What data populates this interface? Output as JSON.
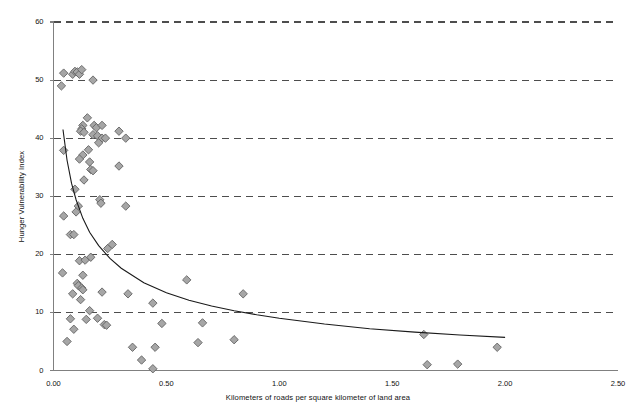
{
  "chart_data": {
    "type": "scatter",
    "title": "",
    "xlabel": "Kilometers of roads per square kilometer of land area",
    "ylabel": "Hunger Vulnerability Index",
    "xlim": [
      0.0,
      2.5
    ],
    "ylim": [
      0,
      60
    ],
    "xticks": [
      0.0,
      0.5,
      1.0,
      1.5,
      2.0,
      2.5
    ],
    "xtick_labels": [
      "0.00",
      "0.50",
      "1.00",
      "1.50",
      "2.00",
      "2.50"
    ],
    "yticks": [
      0,
      10,
      20,
      30,
      40,
      50,
      60
    ],
    "ytick_labels": [
      "0",
      "10",
      "20",
      "30",
      "40",
      "50",
      "60"
    ],
    "grid": "horizontal-dashed",
    "legend": "none",
    "marker": "diamond",
    "marker_fill": "#a6a6a6",
    "marker_stroke": "#636363",
    "marker_size": 4.2,
    "grid_color": "#4d4d4d",
    "axis_color": "#808080",
    "trend_color": "#1a1a1a",
    "points": [
      [
        0.035,
        49.0
      ],
      [
        0.045,
        51.2
      ],
      [
        0.085,
        51.0
      ],
      [
        0.095,
        51.5
      ],
      [
        0.105,
        51.4
      ],
      [
        0.115,
        51.0
      ],
      [
        0.125,
        51.8
      ],
      [
        0.175,
        50.0
      ],
      [
        0.15,
        43.5
      ],
      [
        0.13,
        42.2
      ],
      [
        0.125,
        41.6
      ],
      [
        0.12,
        41.2
      ],
      [
        0.135,
        41.0
      ],
      [
        0.18,
        42.2
      ],
      [
        0.19,
        41.8
      ],
      [
        0.215,
        42.2
      ],
      [
        0.175,
        40.6
      ],
      [
        0.195,
        40.4
      ],
      [
        0.215,
        40.0
      ],
      [
        0.23,
        40.0
      ],
      [
        0.29,
        41.2
      ],
      [
        0.32,
        40.0
      ],
      [
        0.2,
        39.2
      ],
      [
        0.045,
        37.9
      ],
      [
        0.155,
        38.0
      ],
      [
        0.13,
        37.1
      ],
      [
        0.115,
        36.4
      ],
      [
        0.16,
        35.9
      ],
      [
        0.165,
        34.6
      ],
      [
        0.175,
        34.4
      ],
      [
        0.29,
        35.2
      ],
      [
        0.135,
        32.8
      ],
      [
        0.095,
        31.2
      ],
      [
        0.205,
        29.4
      ],
      [
        0.21,
        28.8
      ],
      [
        0.11,
        28.3
      ],
      [
        0.1,
        27.3
      ],
      [
        0.045,
        26.6
      ],
      [
        0.32,
        28.3
      ],
      [
        0.075,
        23.4
      ],
      [
        0.09,
        23.4
      ],
      [
        0.24,
        21.0
      ],
      [
        0.26,
        21.7
      ],
      [
        0.165,
        19.5
      ],
      [
        0.115,
        18.9
      ],
      [
        0.14,
        19.0
      ],
      [
        0.04,
        16.8
      ],
      [
        0.13,
        16.4
      ],
      [
        0.105,
        15.0
      ],
      [
        0.11,
        14.6
      ],
      [
        0.125,
        14.2
      ],
      [
        0.13,
        13.9
      ],
      [
        0.085,
        13.2
      ],
      [
        0.12,
        12.2
      ],
      [
        0.215,
        13.5
      ],
      [
        0.33,
        13.2
      ],
      [
        0.59,
        15.6
      ],
      [
        0.44,
        11.6
      ],
      [
        0.16,
        10.3
      ],
      [
        0.075,
        8.9
      ],
      [
        0.145,
        8.8
      ],
      [
        0.195,
        9.0
      ],
      [
        0.225,
        7.9
      ],
      [
        0.235,
        7.8
      ],
      [
        0.09,
        7.1
      ],
      [
        0.48,
        8.1
      ],
      [
        0.66,
        8.2
      ],
      [
        0.06,
        5.0
      ],
      [
        0.35,
        4.0
      ],
      [
        0.45,
        4.0
      ],
      [
        0.64,
        4.8
      ],
      [
        0.8,
        5.3
      ],
      [
        0.39,
        1.8
      ],
      [
        0.44,
        0.3
      ],
      [
        0.84,
        13.2
      ],
      [
        1.64,
        6.2
      ],
      [
        1.655,
        1.0
      ],
      [
        1.79,
        1.1
      ],
      [
        1.965,
        4.0
      ]
    ],
    "trend": {
      "type": "power",
      "description": "decreasing power-law fit curve",
      "points": [
        [
          0.042,
          41.5
        ],
        [
          0.06,
          36.2
        ],
        [
          0.08,
          32.2
        ],
        [
          0.1,
          29.4
        ],
        [
          0.13,
          26.2
        ],
        [
          0.16,
          23.8
        ],
        [
          0.2,
          21.5
        ],
        [
          0.25,
          19.3
        ],
        [
          0.3,
          17.6
        ],
        [
          0.4,
          15.1
        ],
        [
          0.5,
          13.4
        ],
        [
          0.6,
          12.1
        ],
        [
          0.7,
          11.1
        ],
        [
          0.8,
          10.3
        ],
        [
          0.9,
          9.6
        ],
        [
          1.0,
          9.0
        ],
        [
          1.2,
          8.0
        ],
        [
          1.4,
          7.2
        ],
        [
          1.6,
          6.6
        ],
        [
          1.8,
          6.1
        ],
        [
          2.0,
          5.7
        ]
      ]
    }
  }
}
